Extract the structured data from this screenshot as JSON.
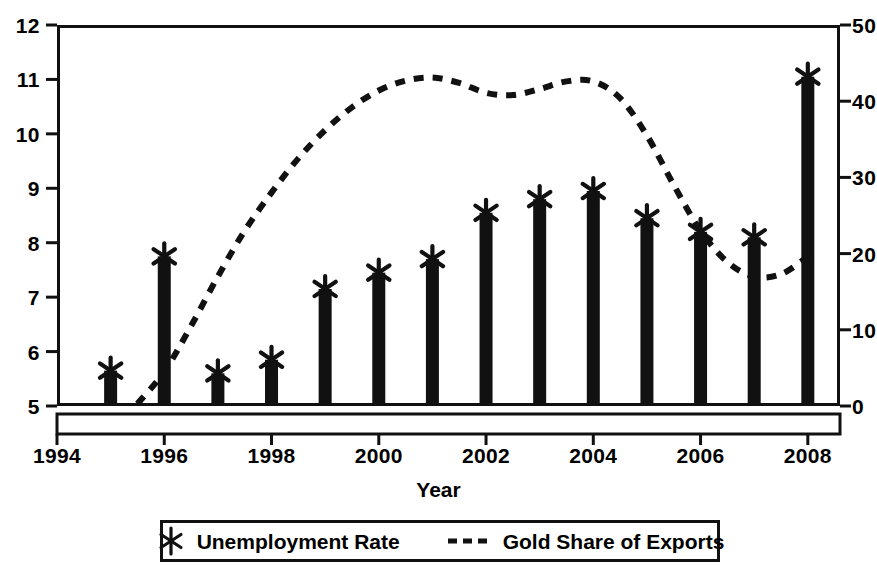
{
  "chart_data": {
    "type": "bar",
    "title": "",
    "xlabel": "Year",
    "ylabel": "",
    "x": [
      1995,
      1996,
      1997,
      1998,
      1999,
      2000,
      2001,
      2002,
      2003,
      2004,
      2005,
      2006,
      2007,
      2008
    ],
    "categories": [
      "1995",
      "1996",
      "1997",
      "1998",
      "1999",
      "2000",
      "2001",
      "2002",
      "2003",
      "2004",
      "2005",
      "2006",
      "2007",
      "2008"
    ],
    "xlim": [
      1994,
      2008.6
    ],
    "x_ticks": [
      1994,
      1996,
      1998,
      2000,
      2002,
      2004,
      2006,
      2008
    ],
    "x_tick_labels": [
      "1994",
      "1996",
      "1998",
      "2000",
      "2002",
      "2004",
      "2006",
      "2008"
    ],
    "grid": false,
    "legend_position": "below-axes",
    "series": [
      {
        "name": "Unemployment Rate",
        "type": "bar",
        "axis": "left",
        "marker": "asterisk-x",
        "color": "#111111",
        "values": [
          5.65,
          7.75,
          5.6,
          5.85,
          7.15,
          7.45,
          7.7,
          8.55,
          8.8,
          8.95,
          8.45,
          8.2,
          8.1,
          11.05
        ]
      },
      {
        "name": "Gold Share of Exports",
        "type": "line",
        "axis": "right",
        "linestyle": "dashed",
        "color": "#111111",
        "x": [
          1995.5,
          1996,
          1996.5,
          1997,
          1997.5,
          1998,
          1998.5,
          1999,
          1999.5,
          2000,
          2000.5,
          2001,
          2001.5,
          2002,
          2002.5,
          2003,
          2003.5,
          2004,
          2004.5,
          2005,
          2005.5,
          2006,
          2006.5,
          2007,
          2007.5,
          2008
        ],
        "values": [
          0.3,
          4.5,
          10.5,
          17.0,
          23.0,
          28.0,
          32.5,
          36.2,
          39.2,
          41.4,
          42.7,
          43.1,
          42.4,
          41.1,
          40.8,
          41.6,
          42.6,
          42.6,
          40.4,
          35.5,
          29.0,
          23.0,
          18.9,
          17.0,
          17.3,
          19.6
        ]
      }
    ],
    "left_axis": {
      "ylim": [
        5,
        12
      ],
      "ticks": [
        5,
        6,
        7,
        8,
        9,
        10,
        11,
        12
      ],
      "tick_labels": [
        "5",
        "6",
        "7",
        "8",
        "9",
        "10",
        "11",
        "12"
      ]
    },
    "right_axis": {
      "ylim": [
        0,
        50
      ],
      "ticks": [
        0,
        10,
        20,
        30,
        40,
        50
      ],
      "tick_labels": [
        "0",
        "10",
        "20",
        "30",
        "40",
        "50"
      ]
    }
  },
  "legend": {
    "entries": [
      {
        "label": "Unemployment Rate",
        "symbol": "asterisk-x-marker"
      },
      {
        "label": "Gold Share of Exports",
        "symbol": "dashed-line"
      }
    ]
  }
}
